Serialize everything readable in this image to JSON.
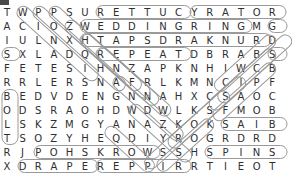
{
  "puzzle": {
    "type": "word-search",
    "rows": 12,
    "cols": 18,
    "cell_width": 15.6,
    "cell_height": 14.0,
    "origin_x": 7,
    "origin_y": 6,
    "letter_color": "#2e2e2e",
    "oval_color": "#9a9a9a",
    "background": "#ffffff",
    "grid": [
      [
        "T",
        "W",
        "P",
        "P",
        "S",
        "U",
        "R",
        "E",
        "T",
        "T",
        "U",
        "C",
        "Y",
        "R",
        "A",
        "T",
        "O",
        "R"
      ],
      [
        "A",
        "C",
        "I",
        "O",
        "Z",
        "W",
        "E",
        "D",
        "D",
        "I",
        "N",
        "G",
        "R",
        "I",
        "N",
        "G",
        "M",
        "G"
      ],
      [
        "I",
        "U",
        "L",
        "N",
        "X",
        "H",
        "T",
        "A",
        "P",
        "S",
        "D",
        "R",
        "A",
        "K",
        "N",
        "U",
        "R",
        "D"
      ],
      [
        "S",
        "X",
        "L",
        "A",
        "D",
        "Q",
        "R",
        "E",
        "P",
        "E",
        "A",
        "T",
        "D",
        "B",
        "R",
        "A",
        "B",
        "S"
      ],
      [
        "F",
        "E",
        "T",
        "E",
        "S",
        "I",
        "H",
        "N",
        "Z",
        "A",
        "P",
        "K",
        "N",
        "H",
        "I",
        "W",
        "C",
        "B"
      ],
      [
        "R",
        "R",
        "L",
        "E",
        "R",
        "S",
        "N",
        "A",
        "F",
        "R",
        "L",
        "K",
        "M",
        "N",
        "C",
        "I",
        "P",
        "F"
      ],
      [
        "B",
        "E",
        "D",
        "V",
        "D",
        "E",
        "N",
        "G",
        "N",
        "N",
        "A",
        "H",
        "X",
        "C",
        "S",
        "A",
        "O",
        "C"
      ],
      [
        "O",
        "D",
        "S",
        "R",
        "A",
        "O",
        "H",
        "D",
        "W",
        "D",
        "W",
        "L",
        "K",
        "S",
        "F",
        "M",
        "O",
        "B"
      ],
      [
        "L",
        "S",
        "K",
        "Z",
        "M",
        "G",
        "Y",
        "A",
        "N",
        "A",
        "Z",
        "K",
        "O",
        "K",
        "S",
        "A",
        "I",
        "B"
      ],
      [
        "T",
        "S",
        "O",
        "Z",
        "Y",
        "H",
        "E",
        "Q",
        "D",
        "I",
        "Y",
        "R",
        "O",
        "G",
        "R",
        "D",
        "R",
        "D"
      ],
      [
        "R",
        "J",
        "P",
        "O",
        "H",
        "S",
        "K",
        "R",
        "O",
        "W",
        "S",
        "S",
        "H",
        "S",
        "P",
        "I",
        "N",
        "S"
      ],
      [
        "X",
        "D",
        "R",
        "A",
        "P",
        "E",
        "R",
        "E",
        "P",
        "P",
        "I",
        "R",
        "R",
        "T",
        "I",
        "E",
        "O",
        "T"
      ]
    ],
    "found_words": [
      {
        "word": "CUTTER",
        "text_in_grid": "RETTUC",
        "row": 0,
        "col_start": 6,
        "col_end": 11,
        "direction": "horizontal-reversed"
      },
      {
        "word": "ROTARY",
        "text_in_grid": "YRATOR",
        "row": 0,
        "col_start": 12,
        "col_end": 17,
        "direction": "horizontal-reversed"
      },
      {
        "word": "WEDDING RING",
        "text_in_grid": "WEDDINGRING",
        "row": 1,
        "col_start": 5,
        "col_end": 15,
        "direction": "horizontal"
      },
      {
        "word": "HTAPSDRAKNURD",
        "text_in_grid": "HTAPSDRAKNURD",
        "row": 2,
        "col_start": 5,
        "col_end": 17,
        "direction": "horizontal"
      },
      {
        "word": "REPEAT",
        "text_in_grid": "REPEAT",
        "row": 3,
        "col_start": 6,
        "col_end": 11,
        "direction": "horizontal"
      },
      {
        "word": "SAIB",
        "text_in_grid": "SAIB",
        "row": 8,
        "col_start": 14,
        "col_end": 17,
        "direction": "horizontal"
      },
      {
        "word": "WORKSHOP",
        "text_in_grid": "POHSKROW",
        "row": 10,
        "col_start": 2,
        "col_end": 9,
        "direction": "horizontal-reversed"
      },
      {
        "word": "SPINS",
        "text_in_grid": "SPINS",
        "row": 10,
        "col_start": 13,
        "col_end": 17,
        "direction": "horizontal"
      },
      {
        "word": "DRAPE",
        "text_in_grid": "DRAPE",
        "row": 11,
        "col_start": 1,
        "col_end": 5,
        "direction": "horizontal"
      },
      {
        "word": "RIPPER",
        "text_in_grid": "REPPIR",
        "row": 11,
        "col_start": 6,
        "col_end": 11,
        "direction": "horizontal-reversed"
      },
      {
        "word": "BOLT",
        "text_in_grid": "BOLT",
        "col": 0,
        "row_start": 6,
        "row_end": 9,
        "direction": "vertical"
      },
      {
        "word": "WCULERE",
        "row_start": 0,
        "col_start": 1,
        "row_end": 6,
        "col_end": 1,
        "direction": "diagonal"
      },
      {
        "word": "SXLADQ",
        "row_start": 3,
        "col_start": 0,
        "direction": "diagonal"
      },
      {
        "word": "diag-2",
        "row_start": 0,
        "col_start": 2,
        "direction": "diagonal-down-right"
      },
      {
        "word": "diag-3",
        "row_start": 0,
        "col_start": 3,
        "direction": "diagonal-down-right"
      },
      {
        "word": "diag-4",
        "row_start": 1,
        "col_start": 4,
        "direction": "diagonal-down-right"
      },
      {
        "word": "diag-5",
        "row_start": 2,
        "col_start": 5,
        "direction": "diagonal-down-right"
      },
      {
        "word": "diag-6",
        "row_start": 3,
        "col_start": 15,
        "direction": "diagonal-down-left"
      },
      {
        "word": "diag-7",
        "row_start": 3,
        "col_start": 17,
        "direction": "diagonal-down-left"
      },
      {
        "word": "diag-8",
        "row_start": 4,
        "col_start": 15,
        "direction": "diagonal-down-left"
      },
      {
        "word": "diag-9",
        "row_start": 5,
        "col_start": 15,
        "direction": "diagonal-down-left"
      },
      {
        "word": "diag-10",
        "row_start": 6,
        "col_start": 13,
        "direction": "diagonal-down-left"
      },
      {
        "word": "diag-11",
        "row_start": 7,
        "col_start": 12,
        "direction": "diagonal-down-left"
      },
      {
        "word": "diag-12",
        "row_start": 8,
        "col_start": 8,
        "direction": "diagonal-down-right"
      },
      {
        "word": "diag-13",
        "row_start": 6,
        "col_start": 7,
        "direction": "diagonal-down-right"
      },
      {
        "word": "diag-14",
        "row_start": 5,
        "col_start": 6,
        "direction": "diagonal-down-right"
      },
      {
        "word": "diag-15",
        "row_start": 9,
        "col_start": 6,
        "direction": "diagonal-down-right"
      }
    ]
  }
}
